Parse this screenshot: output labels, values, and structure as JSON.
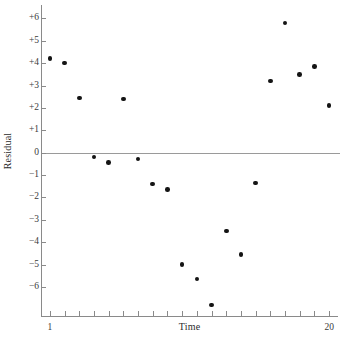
{
  "chart_data": {
    "type": "scatter",
    "title": "",
    "xlabel": "Time",
    "ylabel": "Residual",
    "grid": false,
    "legend": null,
    "xlim": [
      0.4,
      20.6
    ],
    "ylim": [
      -7.3,
      6.6
    ],
    "zero_reference_line": 0,
    "x": [
      1,
      2,
      3,
      4,
      5,
      6,
      7,
      8,
      9,
      10,
      11,
      12,
      13,
      14,
      15,
      16,
      17,
      18,
      19,
      20
    ],
    "values": [
      4.2,
      4.0,
      2.45,
      -0.2,
      -0.45,
      2.4,
      -0.28,
      -1.4,
      -1.65,
      -5.0,
      -5.65,
      -6.8,
      -3.5,
      -4.55,
      -1.35,
      3.2,
      5.8,
      3.5,
      3.85,
      2.1
    ],
    "ytick_values": [
      6,
      5,
      4,
      3,
      2,
      1,
      0,
      -1,
      -2,
      -3,
      -4,
      -5,
      -6
    ],
    "ytick_labels": [
      "+6",
      "+5",
      "+4",
      "+3",
      "+2",
      "+1",
      "0",
      "−1",
      "−2",
      "−3",
      "−4",
      "−5",
      "−6"
    ],
    "xtick_values": [
      1,
      2,
      3,
      4,
      5,
      6,
      7,
      8,
      9,
      10,
      11,
      12,
      13,
      14,
      15,
      16,
      17,
      18,
      19,
      20
    ],
    "xtick_labels": [
      "1",
      "",
      "",
      "",
      "",
      "",
      "",
      "",
      "",
      "",
      "",
      "",
      "",
      "",
      "",
      "",
      "",
      "",
      "",
      "20"
    ],
    "point_color": "#141414",
    "axis_color": "#8a8a8a",
    "zero_line_color": "#9a9a9a"
  }
}
